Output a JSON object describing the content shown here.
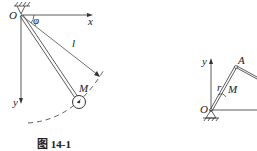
{
  "figure_left": {
    "caption": "图 14-1",
    "labels": {
      "origin": "O",
      "x_axis": "x",
      "y_axis": "y",
      "angle": "φ",
      "length": "l",
      "mass": "M"
    }
  },
  "figure_right": {
    "labels": {
      "origin": "O",
      "y_axis": "y",
      "joint": "A",
      "radius": "r",
      "mass": "M"
    }
  }
}
